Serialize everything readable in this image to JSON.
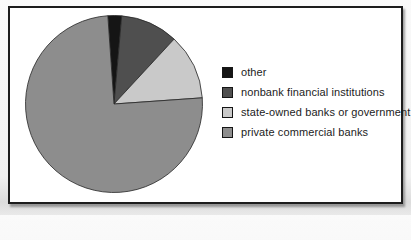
{
  "figure": {
    "background_color": "#ffffff",
    "frame_border_color": "#1d1d1d"
  },
  "chart_data": {
    "type": "pie",
    "title": "",
    "xlabel": "",
    "ylabel": "",
    "unit": "percent_of_whole",
    "legend_position": "right",
    "start_angle_deg": -4,
    "slice_stroke_color": "#262626",
    "slices": [
      {
        "label": "other",
        "value": 2.5,
        "color": "#151515"
      },
      {
        "label": "nonbank financial institutions",
        "value": 10.5,
        "color": "#4f4f4f"
      },
      {
        "label": "state-owned banks or government",
        "value": 12,
        "color": "#c9c9c9"
      },
      {
        "label": "private commercial banks",
        "value": 75,
        "color": "#8d8d8d"
      }
    ]
  }
}
